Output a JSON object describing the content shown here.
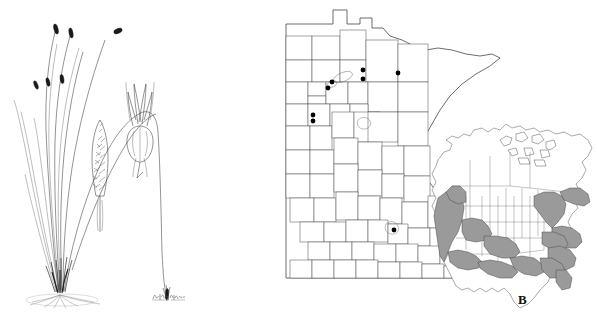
{
  "plate": {
    "background_color": "#ffffff",
    "width": 597,
    "height": 329,
    "ink_color": "#2b2b2b"
  },
  "panel_a": {
    "name": "habit-illustration",
    "subject": "sedge plant habit with inflorescence details",
    "description": "Pen-and-ink botanical illustration of a tufted sedge with arching culms bearing dark terminal spikes, a dense fibrous tufted base at soil line, an enlarged spike detail and an enlarged perigynium with subtending scale.",
    "elements": [
      {
        "name": "arching-culm",
        "label": "culm"
      },
      {
        "name": "terminal-spike",
        "label": "terminal spike"
      },
      {
        "name": "basal-tuft",
        "label": "basal tuft"
      },
      {
        "name": "root-mass",
        "label": "roots at soil line"
      },
      {
        "name": "spike-detail",
        "label": "spike enlargement"
      },
      {
        "name": "perigynium-detail",
        "label": "perigynium enlargement"
      }
    ],
    "signature": {
      "name": "artist-signature",
      "text": "",
      "legible": false,
      "note": "small illegible cursive artist signature"
    }
  },
  "panel_b": {
    "label": "B",
    "name": "distribution-map-panel",
    "minnesota_map": {
      "title": "Minnesota counties",
      "outline_color": "#3c3c3c",
      "county_fill": "#ffffff",
      "county_line_color": "#4a4a4a",
      "collection_dots": [
        {
          "id": 1,
          "x": 363,
          "y": 70,
          "region": "north-central"
        },
        {
          "id": 2,
          "x": 363,
          "y": 79,
          "region": "north-central"
        },
        {
          "id": 3,
          "x": 398,
          "y": 73,
          "region": "northeast-central"
        },
        {
          "id": 4,
          "x": 332,
          "y": 82,
          "region": "northwest-central"
        },
        {
          "id": 5,
          "x": 328,
          "y": 88,
          "region": "northwest-central"
        },
        {
          "id": 6,
          "x": 313,
          "y": 115,
          "region": "west-central"
        },
        {
          "id": 7,
          "x": 313,
          "y": 121,
          "region": "west-central"
        },
        {
          "id": 8,
          "x": 394,
          "y": 230,
          "region": "south-central"
        }
      ],
      "dot_color": "#000000",
      "dot_count": 8
    },
    "north_america_inset": {
      "title": "North America range inset",
      "land_fill": "#ffffff",
      "shade_fill": "#9a9a9a",
      "outline_color": "#555555",
      "shaded_regions": [
        "Pacific Northwest",
        "Northern Rockies",
        "Great Basin",
        "California",
        "Southwest",
        "South Central",
        "Gulf Coast",
        "Great Lakes",
        "Northeast",
        "Appalachians",
        "Southeast"
      ],
      "unshaded_regions": [
        "Northern Great Plains",
        "Canada",
        "Alaska",
        "Mexico"
      ]
    }
  }
}
